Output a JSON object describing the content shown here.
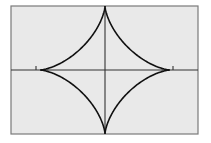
{
  "chart_data": {
    "type": "line",
    "title": "",
    "xlabel": "",
    "ylabel": "",
    "equation": "x^(2/3) + y^(2/3) = a^(2/3)",
    "curve_name": "astroid",
    "series": [
      {
        "name": "astroid",
        "parametric": "x = a*cos^3(t), y = a*sin^3(t)",
        "a": 1,
        "cusps": [
          [
            1,
            0
          ],
          [
            0,
            1
          ],
          [
            -1,
            0
          ],
          [
            0,
            -1
          ]
        ]
      }
    ],
    "xlim": [
      -1.25,
      1.5
    ],
    "ylim": [
      -1,
      1
    ],
    "x_ticks": [
      -1.1,
      1.1
    ],
    "grid": false,
    "legend": "none",
    "colors": {
      "background": "#e9e9e9",
      "frame": "#7a7a7a",
      "axis": "#333333",
      "curve": "#111111",
      "page": "#ffffff"
    }
  }
}
